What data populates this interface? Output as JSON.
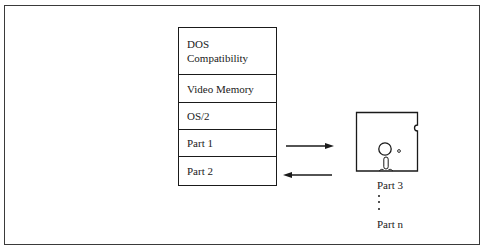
{
  "diagram": {
    "stack": {
      "segments": [
        {
          "lines": [
            "DOS",
            "Compatibility"
          ]
        },
        {
          "lines": [
            "Video Memory"
          ]
        },
        {
          "lines": [
            "OS/2"
          ]
        },
        {
          "lines": [
            "Part 1"
          ]
        },
        {
          "lines": [
            "Part 2"
          ]
        }
      ]
    },
    "arrows": [
      {
        "from": "Part 1",
        "to": "disk",
        "direction": "right"
      },
      {
        "from": "disk",
        "to": "Part 2",
        "direction": "left"
      }
    ],
    "disk": {
      "icon": "floppy-disk-icon",
      "labels": {
        "first": "Part 3",
        "ellipsis": "vertical-ellipsis",
        "last": "Part n"
      }
    },
    "colors": {
      "line": "#1a1a1a",
      "background": "#ffffff"
    }
  }
}
